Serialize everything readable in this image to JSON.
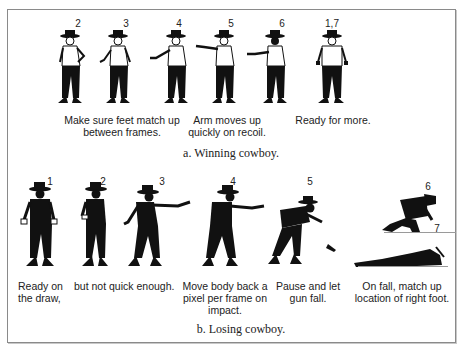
{
  "panel_a": {
    "frames": [
      {
        "label": "2",
        "x": 78
      },
      {
        "label": "3",
        "x": 126
      },
      {
        "label": "4",
        "x": 179
      },
      {
        "label": "5",
        "x": 231
      },
      {
        "label": "6",
        "x": 282
      },
      {
        "label": "1,7",
        "x": 332
      }
    ],
    "captions": [
      "Make sure feet match up\nbetween frames.",
      "Arm moves up\nquickly on recoil.",
      "Ready for more."
    ],
    "subtitle": "a. Winning cowboy."
  },
  "panel_b": {
    "frames": [
      {
        "label": "1",
        "x": 50
      },
      {
        "label": "2",
        "x": 103
      },
      {
        "label": "3",
        "x": 162
      },
      {
        "label": "4",
        "x": 233
      },
      {
        "label": "5",
        "x": 310
      },
      {
        "label": "6",
        "x": 428
      },
      {
        "label": "7",
        "x": 437
      }
    ],
    "captions": [
      "Ready on\nthe draw,",
      "but not quick enough.",
      "Move body back a\npixel per frame on\nimpact.",
      "Pause and let\ngun fall.",
      "On fall, match up\nlocation of right foot."
    ],
    "subtitle": "b. Losing cowboy."
  },
  "colors": {
    "ink": "#111111",
    "frame_border": "#8a8a8a",
    "ground_line": "#9a9a9a"
  }
}
